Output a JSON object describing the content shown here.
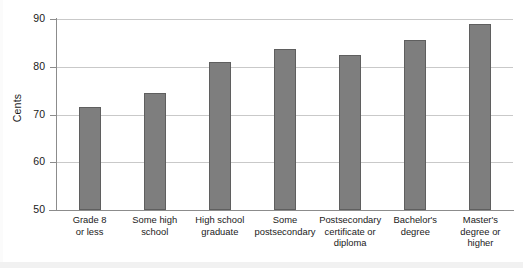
{
  "chart_data": {
    "type": "bar",
    "title": "",
    "subtitle": "",
    "xlabel": "",
    "ylabel": "Cents",
    "ylim": [
      50,
      90
    ],
    "yticks": [
      50,
      60,
      70,
      80,
      90
    ],
    "ytick_labels": [
      "50",
      "60",
      "70",
      "80",
      "90"
    ],
    "grid": true,
    "legend": "none",
    "bar_color": "#7e7e7e",
    "bar_edge_color": "#5f5f5f",
    "categories": [
      "Grade 8 or less",
      "Some high school",
      "High school graduate",
      "Some postsecondary",
      "Postsecondary certificate or diploma",
      "Bachelor's degree",
      "Master's degree or higher"
    ],
    "category_lines": [
      [
        "Grade 8",
        "or less"
      ],
      [
        "Some high",
        "school"
      ],
      [
        "High school",
        "graduate"
      ],
      [
        "Some",
        "postsecondary"
      ],
      [
        "Postsecondary",
        "certificate or",
        "diploma"
      ],
      [
        "Bachelor's",
        "degree"
      ],
      [
        "Master's",
        "degree or",
        "higher"
      ]
    ],
    "values": [
      71.6,
      74.5,
      81.1,
      83.8,
      82.5,
      85.6,
      89.0
    ],
    "series": [
      {
        "name": "Cents",
        "values": [
          71.6,
          74.5,
          81.1,
          83.8,
          82.5,
          85.6,
          89.0
        ]
      }
    ]
  }
}
